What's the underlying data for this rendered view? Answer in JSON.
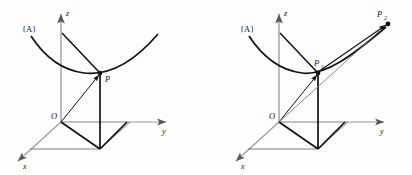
{
  "figure": {
    "background_color": "#fdfdfd",
    "ink_color": "#111111",
    "axis_color": "#8c8c8c",
    "width": 412,
    "height": 175
  },
  "panels": [
    {
      "id": "left-panel",
      "name": "single-point-diagram",
      "frame_label": "{A}",
      "axes": [
        {
          "name": "z-axis",
          "label": "z",
          "direction": "up"
        },
        {
          "name": "y-axis",
          "label": "y",
          "direction": "right"
        },
        {
          "name": "x-axis",
          "label": "x",
          "direction": "down-left"
        }
      ],
      "origin_label": "O",
      "points": [
        {
          "name": "point-p",
          "label": "P",
          "sub": ""
        }
      ],
      "curve_name": "space-curve-A",
      "vectors": [
        {
          "name": "position-vector-op",
          "from": "O",
          "to": "P"
        }
      ]
    },
    {
      "id": "right-panel",
      "name": "two-point-diagram",
      "frame_label": "{A}",
      "axes": [
        {
          "name": "z-axis",
          "label": "z",
          "direction": "up"
        },
        {
          "name": "y-axis",
          "label": "y",
          "direction": "right"
        },
        {
          "name": "x-axis",
          "label": "x",
          "direction": "down-left"
        }
      ],
      "origin_label": "O",
      "points": [
        {
          "name": "point-p1",
          "label": "P",
          "sub": "1"
        },
        {
          "name": "point-p2",
          "label": "P",
          "sub": "2"
        }
      ],
      "curve_name": "space-curve-A",
      "vectors": [
        {
          "name": "position-vector-op1",
          "from": "O",
          "to": "P1"
        },
        {
          "name": "position-vector-op2",
          "from": "O",
          "to": "P2"
        },
        {
          "name": "chord-vector-p1p2",
          "from": "P1",
          "to": "P2"
        }
      ]
    }
  ]
}
